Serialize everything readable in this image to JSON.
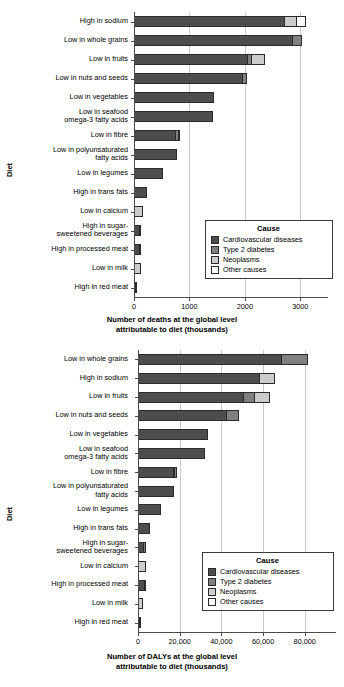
{
  "colors": {
    "cardiovascular": "#4d4d4d",
    "diabetes": "#808080",
    "neoplasms": "#cccccc",
    "other": "#ffffff",
    "axis": "#4a4a4a",
    "grid": "#c9c9c9"
  },
  "legend": {
    "title": "Cause",
    "entries": [
      {
        "label": "Cardiovascular diseases",
        "key": "cardiovascular"
      },
      {
        "label": "Type 2 diabetes",
        "key": "diabetes"
      },
      {
        "label": "Neoplasms",
        "key": "neoplasms"
      },
      {
        "label": "Other causes",
        "key": "other"
      }
    ]
  },
  "chart_data": [
    {
      "id": "deaths",
      "type": "bar",
      "orientation": "horizontal",
      "stacked": true,
      "title": "",
      "xlabel": "Number of deaths at the global level attributable to diet (thousands)",
      "xlabel_line1": "Number of deaths at the global level",
      "xlabel_line2": "attributable to diet (thousands)",
      "ylabel": "Diet",
      "xlim": [
        0,
        3500
      ],
      "xticks": [
        0,
        1000,
        2000,
        3000
      ],
      "xticklabels": [
        "0",
        "1000",
        "2000",
        "3000"
      ],
      "grid": "vertical",
      "legend_position": "lower right",
      "categories": [
        "High in sodium",
        "Low in whole grains",
        "Low in fruits",
        "Low in nuts and seeds",
        "Low in vegetables",
        "Low in seafood omega-3 fatty acids",
        "Low in fibre",
        "Low in polyunsaturated fatty acids",
        "Low in legumes",
        "High in trans fats",
        "Low in calcium",
        "High in sugar-sweetened beverages",
        "High in processed meat",
        "Low in milk",
        "High in red meat"
      ],
      "category_lines": [
        [
          "High in sodium"
        ],
        [
          "Low in whole grains"
        ],
        [
          "Low in fruits"
        ],
        [
          "Low in nuts and seeds"
        ],
        [
          "Low in vegetables"
        ],
        [
          "Low in seafood",
          "omega-3 fatty acids"
        ],
        [
          "Low in fibre"
        ],
        [
          "Low in polyunsaturated",
          "fatty acids"
        ],
        [
          "Low in legumes"
        ],
        [
          "High in trans fats"
        ],
        [
          "Low in calcium"
        ],
        [
          "High in sugar-",
          "sweetened beverages"
        ],
        [
          "High in processed meat"
        ],
        [
          "Low in milk"
        ],
        [
          "High in red meat"
        ]
      ],
      "series": [
        {
          "name": "Cardiovascular diseases",
          "key": "cardiovascular",
          "values": [
            2720,
            2870,
            2050,
            1960,
            1440,
            1420,
            760,
            780,
            520,
            240,
            0,
            110,
            105,
            0,
            15
          ]
        },
        {
          "name": "Type 2 diabetes",
          "key": "diabetes",
          "values": [
            0,
            170,
            90,
            90,
            0,
            0,
            60,
            0,
            0,
            0,
            0,
            20,
            0,
            0,
            5
          ]
        },
        {
          "name": "Neoplasms",
          "key": "neoplasms",
          "values": [
            230,
            0,
            260,
            0,
            0,
            0,
            30,
            0,
            0,
            0,
            170,
            0,
            15,
            120,
            0
          ]
        },
        {
          "name": "Other causes",
          "key": "other",
          "values": [
            180,
            0,
            0,
            0,
            0,
            0,
            0,
            0,
            0,
            0,
            0,
            0,
            0,
            0,
            0
          ]
        }
      ],
      "totals": [
        3130,
        3040,
        2400,
        2050,
        1440,
        1420,
        850,
        780,
        520,
        240,
        170,
        130,
        120,
        120,
        20
      ]
    },
    {
      "id": "dalys",
      "type": "bar",
      "orientation": "horizontal",
      "stacked": true,
      "title": "",
      "xlabel": "Number of DALYs at the global level attributable to diet (thousands)",
      "xlabel_line1": "Number of DALYs at the global level",
      "xlabel_line2": "attributable to diet (thousands)",
      "ylabel": "Diet",
      "xlim": [
        0,
        95000
      ],
      "xticks": [
        0,
        20000,
        40000,
        60000,
        80000
      ],
      "xticklabels": [
        "0",
        "20,000",
        "40,000",
        "60,000",
        "80,000"
      ],
      "grid": "vertical",
      "legend_position": "lower right",
      "categories": [
        "Low in whole grains",
        "High in sodium",
        "Low in fruits",
        "Low in nuts and seeds",
        "Low in vegetables",
        "Low in seafood omega-3 fatty acids",
        "Low in fibre",
        "Low in polyunsaturated fatty acids",
        "Low in legumes",
        "High in trans fats",
        "High in sugar-sweetened beverages",
        "Low in calcium",
        "High in processed meat",
        "Low in milk",
        "High in red meat"
      ],
      "category_lines": [
        [
          "Low in whole grains"
        ],
        [
          "High in sodium"
        ],
        [
          "Low in fruits"
        ],
        [
          "Low in nuts and seeds"
        ],
        [
          "Low in vegetables"
        ],
        [
          "Low in seafood",
          "omega-3 fatty acids"
        ],
        [
          "Low in fibre"
        ],
        [
          "Low in polyunsaturated",
          "fatty acids"
        ],
        [
          "Low in legumes"
        ],
        [
          "High in trans fats"
        ],
        [
          "High in sugar-",
          "sweetened beverages"
        ],
        [
          "Low in calcium"
        ],
        [
          "High in processed meat"
        ],
        [
          "Low in milk"
        ],
        [
          "High in red meat"
        ]
      ],
      "series": [
        {
          "name": "Cardiovascular diseases",
          "key": "cardiovascular",
          "values": [
            69000,
            58500,
            51000,
            42500,
            33500,
            32000,
            17500,
            17500,
            11000,
            5800,
            2800,
            0,
            3200,
            0,
            900
          ]
        },
        {
          "name": "Type 2 diabetes",
          "key": "diabetes",
          "values": [
            13000,
            0,
            5500,
            6500,
            0,
            0,
            1800,
            0,
            0,
            0,
            1200,
            0,
            0,
            0,
            300
          ]
        },
        {
          "name": "Neoplasms",
          "key": "neoplasms",
          "values": [
            0,
            7500,
            7500,
            0,
            0,
            0,
            0,
            0,
            0,
            0,
            0,
            3600,
            400,
            2600,
            0
          ]
        },
        {
          "name": "Other causes",
          "key": "other",
          "values": [
            0,
            0,
            0,
            0,
            0,
            0,
            0,
            0,
            0,
            0,
            0,
            0,
            0,
            0,
            0
          ]
        }
      ],
      "totals": [
        82000,
        66000,
        64000,
        49000,
        33500,
        32000,
        19300,
        17500,
        11000,
        5800,
        4000,
        3600,
        3600,
        2600,
        1200
      ]
    }
  ]
}
